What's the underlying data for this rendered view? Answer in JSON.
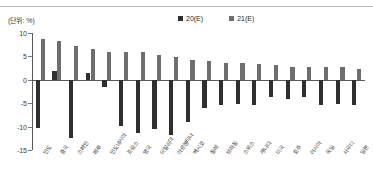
{
  "unit_note": "(단위: %)",
  "legend": {
    "position": "top-center",
    "items": [
      {
        "label": "20(E)",
        "color": "#2f2f2f"
      },
      {
        "label": "21(E)",
        "color": "#6e6e6e"
      }
    ]
  },
  "colors": {
    "series_2020": "#2f2f2f",
    "series_2021": "#6e6e6e",
    "axis": "#5a5a5a",
    "text": "#3a3a3a",
    "rule": "#b9b9b9"
  },
  "chart_data": {
    "type": "bar",
    "title": "",
    "subtitle": "",
    "xlabel": "",
    "ylabel": "",
    "unit": "%",
    "grid": false,
    "legend_position": "top-center",
    "ylim": [
      -15,
      10
    ],
    "yticks": [
      10,
      5,
      0,
      -5,
      -10,
      -15
    ],
    "ytick_labels": [
      "10",
      "5",
      "0",
      "-5",
      "-10",
      "-15"
    ],
    "categories": [
      "인도",
      "중국",
      "스페인",
      "페루",
      "인도네시아",
      "프랑스",
      "영국",
      "이탈리아",
      "아르헨티나",
      "멕시코",
      "칠레",
      "브라질",
      "스위스",
      "캐나다",
      "미국",
      "호주",
      "러시아",
      "독일",
      "사우디",
      "일본"
    ],
    "series": [
      {
        "name": "20(E)",
        "color": "#2f2f2f",
        "values": [
          -10.3,
          1.8,
          -12.4,
          1.5,
          -1.5,
          -9.8,
          -11.3,
          -10.6,
          -11.8,
          -9.0,
          -6.0,
          -5.3,
          -5.1,
          -5.4,
          -3.7,
          -4.2,
          -3.6,
          -5.4,
          -5.2,
          -5.3
        ]
      },
      {
        "name": "21(E)",
        "color": "#6e6e6e",
        "values": [
          8.8,
          8.2,
          7.2,
          6.6,
          6.0,
          5.9,
          5.9,
          5.2,
          4.9,
          4.2,
          4.0,
          3.6,
          3.5,
          3.3,
          3.1,
          2.8,
          2.8,
          2.7,
          2.7,
          2.3
        ]
      }
    ]
  }
}
